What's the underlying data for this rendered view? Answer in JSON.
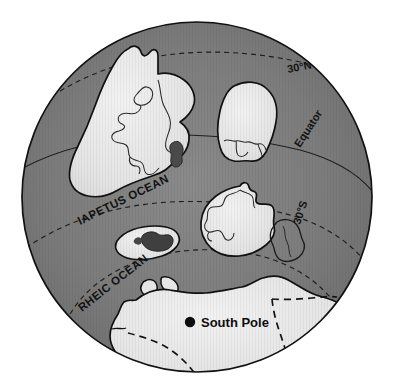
{
  "figure": {
    "kind": "paleogeographic-globe-map",
    "projection": "orthographic-south-polar",
    "background_color": "#ffffff"
  },
  "colors": {
    "ocean": "#7d7d7d",
    "ocean_shade": "#6f6f6f",
    "land": "#e2e2e2",
    "land_highlight": "#efefef",
    "land_dark_patch": "#4a4a4a",
    "outline": "#111111",
    "graticule": "#1a1a1a",
    "label_text": "#121212"
  },
  "globe": {
    "center_x": 197,
    "center_y": 197,
    "radius": 175,
    "outline_width": 1.6
  },
  "graticules": [
    {
      "name": "latitude-30n",
      "label": "30°N",
      "label_x": 288,
      "label_y": 73,
      "rotate": -11,
      "dash": "5,4"
    },
    {
      "name": "latitude-equator",
      "label": "Equator",
      "label_x": 300,
      "label_y": 148,
      "rotate": -57,
      "dash": "none"
    },
    {
      "name": "latitude-30s",
      "label": "30°S",
      "label_x": 300,
      "label_y": 225,
      "rotate": -72,
      "dash": "5,4"
    },
    {
      "name": "latitude-60s",
      "label": "",
      "label_x": 0,
      "label_y": 0,
      "rotate": 0,
      "dash": "5,4"
    }
  ],
  "ocean_labels": [
    {
      "name": "iapetus-ocean",
      "text": "IAPETUS OCEAN",
      "x": 80,
      "y": 225,
      "rotate": -26
    },
    {
      "name": "rheic-ocean",
      "text": "RHEIC OCEAN",
      "x": 82,
      "y": 312,
      "rotate": -38
    }
  ],
  "markers": [
    {
      "name": "south-pole",
      "label": "South Pole",
      "dot_x": 190,
      "dot_y": 322,
      "dot_r": 5.2,
      "label_x": 201,
      "label_y": 327
    }
  ],
  "landmasses": [
    {
      "name": "laurentia-northwest-continent",
      "label": ""
    },
    {
      "name": "siberia-oval-continent",
      "label": ""
    },
    {
      "name": "baltica-island",
      "label": ""
    },
    {
      "name": "gondwana-central-continent",
      "label": ""
    },
    {
      "name": "east-outline-block",
      "label": ""
    },
    {
      "name": "southern-polar-continent",
      "label": ""
    },
    {
      "name": "small-island-round",
      "label": ""
    },
    {
      "name": "small-island-triangle",
      "label": ""
    }
  ]
}
